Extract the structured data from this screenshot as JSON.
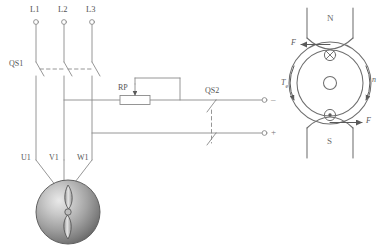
{
  "diagram": {
    "stroke_color": "#7d7d7d",
    "accent_color": "#555555"
  },
  "left_circuit": {
    "supply_terminals": [
      {
        "label": "L1"
      },
      {
        "label": "L2"
      },
      {
        "label": "L3"
      }
    ],
    "motor_terminals": [
      {
        "label": "U1"
      },
      {
        "label": "V1"
      },
      {
        "label": "W1"
      }
    ],
    "switches": [
      {
        "label": "QS1",
        "type": "three-pole-disconnect"
      },
      {
        "label": "QS2",
        "type": "two-pole-disconnect"
      }
    ],
    "components": [
      {
        "label": "RP",
        "type": "rheostat"
      }
    ],
    "dc_terminals": [
      {
        "sign": "–"
      },
      {
        "sign": "+"
      }
    ],
    "motor": {
      "type": "induction-motor",
      "shape": "sphere-with-rotor"
    }
  },
  "right_diagram": {
    "poles": [
      {
        "label": "N",
        "position": "top"
      },
      {
        "label": "S",
        "position": "bottom"
      }
    ],
    "vectors": [
      {
        "label": "F",
        "position": "upper-left",
        "direction": "left"
      },
      {
        "label": "F",
        "position": "lower-right",
        "direction": "right"
      }
    ],
    "torque": {
      "label": "T",
      "subscript": "e",
      "direction": "counter-clockwise"
    },
    "speed": {
      "label": "n",
      "direction": "clockwise"
    },
    "conductors": [
      {
        "marker": "cross",
        "meaning": "current-into-page",
        "position": "top"
      },
      {
        "marker": "dot",
        "meaning": "current-out-of-page",
        "position": "bottom"
      }
    ],
    "shaft": {
      "shape": "circle",
      "position": "center"
    }
  }
}
